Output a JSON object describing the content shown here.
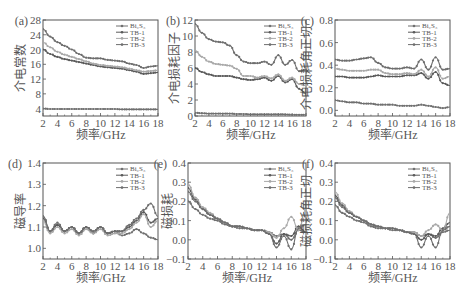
{
  "figure": {
    "background": "#ffffff",
    "axis_color": "#555555",
    "text_color": "#555555"
  },
  "legend": [
    "Bi₂S₃",
    "TB-1",
    "TB-2",
    "TB-3"
  ],
  "series_colors": [
    "#707070",
    "#5a5a5a",
    "#a8a8a8",
    "#6e6e6e"
  ],
  "chart_data": [
    {
      "type": "line",
      "panel_label": "(a)",
      "xlabel": "频率/GHz",
      "ylabel": "介电常数",
      "xlim": [
        2,
        18
      ],
      "ylim": [
        2,
        28
      ],
      "xticks": [
        2,
        4,
        6,
        8,
        10,
        12,
        14,
        16,
        18
      ],
      "yticks": [
        4,
        8,
        12,
        16,
        20,
        24,
        28
      ],
      "ytick_labels": [
        "4",
        "8",
        "12",
        "16",
        "20",
        "24",
        "28"
      ],
      "legend_position": "upper right",
      "x": [
        2,
        3,
        4,
        5,
        6,
        7,
        8,
        9,
        10,
        11,
        12,
        13,
        14,
        15,
        16,
        17,
        18
      ],
      "series": [
        {
          "name": "Bi₂S₃",
          "values": [
            4,
            3.9,
            3.9,
            3.9,
            3.9,
            3.9,
            3.9,
            3.9,
            3.9,
            3.9,
            3.9,
            3.8,
            3.8,
            3.8,
            3.8,
            3.8,
            3.8
          ]
        },
        {
          "name": "TB-1",
          "values": [
            20,
            18.8,
            18,
            17.4,
            17,
            16.6,
            16.2,
            15.8,
            15.4,
            15.2,
            15,
            14.8,
            14.4,
            14,
            13.4,
            13.6,
            13.8
          ]
        },
        {
          "name": "TB-2",
          "values": [
            22,
            20.6,
            19.4,
            18.6,
            18,
            17.4,
            16.8,
            16.2,
            15.8,
            15.6,
            15.4,
            15.2,
            14.8,
            14.4,
            14,
            14.2,
            14.4
          ]
        },
        {
          "name": "TB-3",
          "values": [
            25.5,
            23.5,
            22,
            21,
            20,
            18.8,
            17.8,
            17.6,
            17.6,
            17.2,
            17,
            16.8,
            16.2,
            15.8,
            15,
            15.4,
            15.6
          ]
        }
      ]
    },
    {
      "type": "line",
      "panel_label": "(b)",
      "xlabel": "频率/GHz",
      "ylabel": "介电损耗因子",
      "xlim": [
        2,
        18
      ],
      "ylim": [
        0,
        12
      ],
      "xticks": [
        2,
        4,
        6,
        8,
        10,
        12,
        14,
        16,
        18
      ],
      "yticks": [
        0,
        2,
        4,
        6,
        8,
        10,
        12
      ],
      "ytick_labels": [
        "0",
        "2",
        "4",
        "6",
        "8",
        "10",
        "12"
      ],
      "legend_position": "upper right",
      "x": [
        2,
        3,
        4,
        5,
        6,
        7,
        8,
        9,
        10,
        11,
        12,
        13,
        14,
        15,
        16,
        17,
        18
      ],
      "series": [
        {
          "name": "Bi₂S₃",
          "values": [
            0.4,
            0.35,
            0.3,
            0.3,
            0.3,
            0.3,
            0.25,
            0.25,
            0.2,
            0.2,
            0.2,
            0.2,
            0.2,
            0.2,
            0.15,
            0.15,
            0.15
          ]
        },
        {
          "name": "TB-1",
          "values": [
            6,
            5.5,
            5.2,
            5,
            5,
            5,
            4.8,
            4.6,
            4.5,
            4.6,
            4.8,
            4.4,
            5,
            4.2,
            4.6,
            3.4,
            2.8
          ]
        },
        {
          "name": "TB-2",
          "values": [
            8.2,
            7.4,
            6.8,
            6.5,
            6.4,
            6.3,
            5.9,
            5,
            5,
            4.8,
            5,
            4.7,
            5.2,
            4.4,
            4.8,
            4,
            3.8
          ]
        },
        {
          "name": "TB-3",
          "values": [
            11.5,
            10.4,
            9.6,
            9.3,
            9.2,
            8.8,
            7.6,
            6.8,
            6.6,
            6.6,
            6.8,
            6.4,
            7.6,
            6.4,
            7,
            5.6,
            5.8
          ]
        }
      ]
    },
    {
      "type": "line",
      "panel_label": "(c)",
      "xlabel": "频率/GHz",
      "ylabel": "介电损耗角正切",
      "xlim": [
        2,
        18
      ],
      "ylim": [
        -0.05,
        0.8
      ],
      "xticks": [
        2,
        4,
        6,
        8,
        10,
        12,
        14,
        16,
        18
      ],
      "yticks": [
        0.0,
        0.2,
        0.4,
        0.6,
        0.8
      ],
      "ytick_labels": [
        "0.0",
        "0.2",
        "0.4",
        "0.6",
        "0.8"
      ],
      "legend_position": "upper right",
      "x": [
        2,
        3,
        4,
        5,
        6,
        7,
        8,
        9,
        10,
        11,
        12,
        13,
        14,
        15,
        16,
        17,
        18
      ],
      "series": [
        {
          "name": "Bi₂S₃",
          "values": [
            0.09,
            0.08,
            0.07,
            0.07,
            0.06,
            0.06,
            0.05,
            0.05,
            0.05,
            0.04,
            0.04,
            0.04,
            0.05,
            0.04,
            0.03,
            0.02,
            0.03
          ]
        },
        {
          "name": "TB-1",
          "values": [
            0.3,
            0.3,
            0.29,
            0.29,
            0.29,
            0.3,
            0.31,
            0.3,
            0.3,
            0.3,
            0.31,
            0.31,
            0.33,
            0.28,
            0.34,
            0.24,
            0.22
          ]
        },
        {
          "name": "TB-2",
          "values": [
            0.37,
            0.36,
            0.35,
            0.35,
            0.35,
            0.36,
            0.36,
            0.33,
            0.32,
            0.32,
            0.33,
            0.32,
            0.36,
            0.3,
            0.38,
            0.28,
            0.3
          ]
        },
        {
          "name": "TB-3",
          "values": [
            0.45,
            0.44,
            0.44,
            0.45,
            0.46,
            0.47,
            0.42,
            0.38,
            0.37,
            0.37,
            0.38,
            0.37,
            0.45,
            0.36,
            0.47,
            0.36,
            0.37
          ]
        }
      ]
    },
    {
      "type": "line",
      "panel_label": "(d)",
      "xlabel": "频率/GHz",
      "ylabel": "磁导率",
      "xlim": [
        2,
        18
      ],
      "ylim": [
        0.95,
        1.4
      ],
      "xticks": [
        2,
        4,
        6,
        8,
        10,
        12,
        14,
        16,
        18
      ],
      "yticks": [
        1.0,
        1.1,
        1.2,
        1.3,
        1.4
      ],
      "ytick_labels": [
        "1.0",
        "1.1",
        "1.2",
        "1.3",
        "1.4"
      ],
      "legend_position": "upper right",
      "x": [
        2,
        3,
        4,
        5,
        6,
        7,
        8,
        9,
        10,
        11,
        12,
        13,
        14,
        15,
        16,
        17,
        18
      ],
      "series": [
        {
          "name": "Bi₂S₃",
          "values": [
            1.15,
            1.08,
            1.11,
            1.08,
            1.1,
            1.07,
            1.1,
            1.08,
            1.1,
            1.07,
            1.08,
            1.06,
            1.07,
            1.09,
            1.07,
            1.05,
            1.04
          ]
        },
        {
          "name": "TB-1",
          "values": [
            1.14,
            1.08,
            1.11,
            1.08,
            1.1,
            1.07,
            1.1,
            1.07,
            1.1,
            1.07,
            1.08,
            1.08,
            1.1,
            1.13,
            1.17,
            1.12,
            1.14
          ]
        },
        {
          "name": "TB-2",
          "values": [
            1.13,
            1.07,
            1.1,
            1.07,
            1.09,
            1.06,
            1.09,
            1.07,
            1.09,
            1.06,
            1.07,
            1.07,
            1.09,
            1.12,
            1.16,
            1.1,
            1.13
          ]
        },
        {
          "name": "TB-3",
          "values": [
            1.15,
            1.08,
            1.12,
            1.08,
            1.1,
            1.07,
            1.1,
            1.08,
            1.1,
            1.07,
            1.08,
            1.08,
            1.11,
            1.14,
            1.18,
            1.21,
            1.15
          ]
        }
      ]
    },
    {
      "type": "line",
      "panel_label": "(e)",
      "xlabel": "频率/GHz",
      "ylabel": "磁损耗",
      "xlim": [
        2,
        18
      ],
      "ylim": [
        -0.1,
        0.4
      ],
      "xticks": [
        2,
        4,
        6,
        8,
        10,
        12,
        14,
        16,
        18
      ],
      "yticks": [
        -0.1,
        0.0,
        0.1,
        0.2,
        0.3,
        0.4
      ],
      "ytick_labels": [
        "−0.1",
        "0.0",
        "0.1",
        "0.2",
        "0.3",
        "0.4"
      ],
      "legend_position": "upper right",
      "x": [
        2,
        3,
        4,
        5,
        6,
        7,
        8,
        9,
        10,
        11,
        12,
        13,
        14,
        15,
        16,
        17,
        18
      ],
      "series": [
        {
          "name": "Bi₂S₃",
          "values": [
            0.2,
            0.16,
            0.13,
            0.11,
            0.1,
            0.08,
            0.07,
            0.06,
            0.06,
            0.05,
            0.05,
            0.04,
            0.02,
            0.03,
            0.0,
            0.05,
            0.04
          ]
        },
        {
          "name": "TB-1",
          "values": [
            0.27,
            0.21,
            0.16,
            0.13,
            0.11,
            0.09,
            0.07,
            0.07,
            0.06,
            0.05,
            0.05,
            0.03,
            -0.02,
            0.03,
            0.02,
            0.07,
            0.04
          ]
        },
        {
          "name": "TB-2",
          "values": [
            0.29,
            0.22,
            0.17,
            0.14,
            0.11,
            0.09,
            0.07,
            0.07,
            0.06,
            0.05,
            0.05,
            0.04,
            0.01,
            0.06,
            0.12,
            0.05,
            0.16
          ]
        },
        {
          "name": "TB-3",
          "values": [
            0.25,
            0.2,
            0.16,
            0.13,
            0.11,
            0.09,
            0.07,
            0.07,
            0.06,
            0.05,
            0.05,
            0.03,
            -0.04,
            0.02,
            -0.05,
            0.06,
            0.08
          ]
        }
      ]
    },
    {
      "type": "line",
      "panel_label": "(f)",
      "xlabel": "频率/GHz",
      "ylabel": "磁损耗角正切",
      "xlim": [
        2,
        18
      ],
      "ylim": [
        -0.1,
        0.4
      ],
      "xticks": [
        2,
        4,
        6,
        8,
        10,
        12,
        14,
        16,
        18
      ],
      "yticks": [
        -0.1,
        0.0,
        0.1,
        0.2,
        0.3,
        0.4
      ],
      "ytick_labels": [
        "−0.1",
        "0.0",
        "0.1",
        "0.2",
        "0.3",
        "0.4"
      ],
      "legend_position": "upper right",
      "x": [
        2,
        3,
        4,
        5,
        6,
        7,
        8,
        9,
        10,
        11,
        12,
        13,
        14,
        15,
        16,
        17,
        18
      ],
      "series": [
        {
          "name": "Bi₂S₃",
          "values": [
            0.18,
            0.14,
            0.12,
            0.1,
            0.09,
            0.07,
            0.06,
            0.06,
            0.05,
            0.05,
            0.04,
            0.04,
            0.02,
            0.03,
            0.01,
            0.04,
            0.05
          ]
        },
        {
          "name": "TB-1",
          "values": [
            0.23,
            0.18,
            0.14,
            0.12,
            0.1,
            0.08,
            0.07,
            0.06,
            0.06,
            0.05,
            0.04,
            0.03,
            0.0,
            0.03,
            0.02,
            0.06,
            0.09
          ]
        },
        {
          "name": "TB-2",
          "values": [
            0.25,
            0.19,
            0.15,
            0.12,
            0.1,
            0.08,
            0.07,
            0.06,
            0.06,
            0.05,
            0.04,
            0.04,
            0.02,
            0.05,
            0.08,
            0.05,
            0.14
          ]
        },
        {
          "name": "TB-3",
          "values": [
            0.22,
            0.17,
            0.14,
            0.12,
            0.1,
            0.08,
            0.07,
            0.06,
            0.06,
            0.05,
            0.04,
            0.03,
            -0.04,
            0.02,
            -0.04,
            0.05,
            0.07
          ]
        }
      ]
    }
  ]
}
